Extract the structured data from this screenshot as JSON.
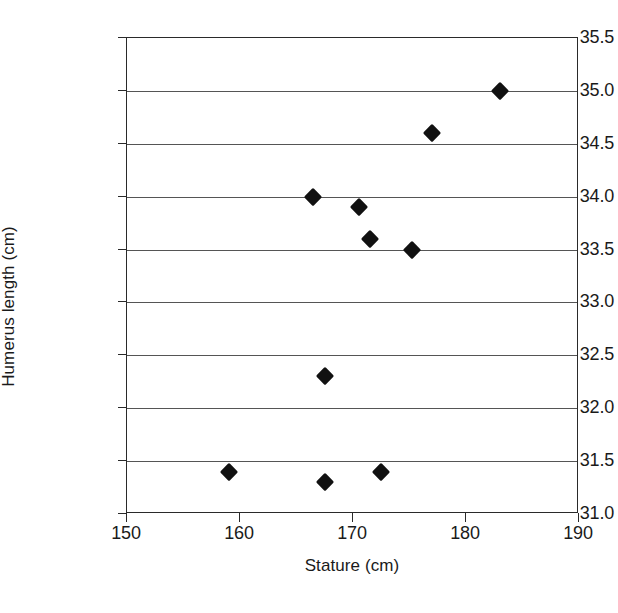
{
  "chart_data": {
    "type": "scatter",
    "title": "",
    "xlabel": "Stature (cm)",
    "ylabel": "Humerus length (cm)",
    "xlim": [
      150,
      190
    ],
    "ylim": [
      31.0,
      35.5
    ],
    "xticks": [
      "150",
      "160",
      "170",
      "180",
      "190"
    ],
    "xtick_values": [
      150,
      160,
      170,
      180,
      190
    ],
    "yticks": [
      "31.0",
      "31.5",
      "32.0",
      "32.5",
      "33.0",
      "33.5",
      "34.0",
      "34.5",
      "35.0",
      "35.5"
    ],
    "ytick_values": [
      31.0,
      31.5,
      32.0,
      32.5,
      33.0,
      33.5,
      34.0,
      34.5,
      35.0,
      35.5
    ],
    "grid": "horizontal",
    "legend": "none",
    "marker_style": "filled-diamond",
    "marker_color": "#111111",
    "series": [
      {
        "name": "Humerus length vs stature",
        "points": [
          {
            "x": 159.0,
            "y": 31.4
          },
          {
            "x": 167.5,
            "y": 31.3
          },
          {
            "x": 172.5,
            "y": 31.4
          },
          {
            "x": 167.5,
            "y": 32.3
          },
          {
            "x": 166.5,
            "y": 34.0
          },
          {
            "x": 170.5,
            "y": 33.9
          },
          {
            "x": 171.5,
            "y": 33.6
          },
          {
            "x": 175.2,
            "y": 33.5
          },
          {
            "x": 177.0,
            "y": 34.6
          },
          {
            "x": 183.0,
            "y": 35.0
          }
        ]
      }
    ]
  }
}
